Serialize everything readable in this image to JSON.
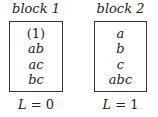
{
  "blocks": [
    {
      "title": "block 1",
      "items": [
        "(1)",
        "ab",
        "ac",
        "bc"
      ],
      "level_var": "L",
      "level_eq": " = 0"
    },
    {
      "title": "block 2",
      "items": [
        "a",
        "b",
        "c",
        "abc"
      ],
      "level_var": "L",
      "level_eq": " = 1"
    }
  ]
}
